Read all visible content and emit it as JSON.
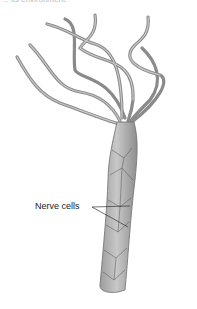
{
  "caption": "... its environment.",
  "figure": {
    "labels": [
      {
        "text": "Nerve cells",
        "pointer_count": 2
      }
    ],
    "colors": {
      "body": "#a9a9a9",
      "outline": "#6e6e6e",
      "nerve": "#333333"
    }
  }
}
